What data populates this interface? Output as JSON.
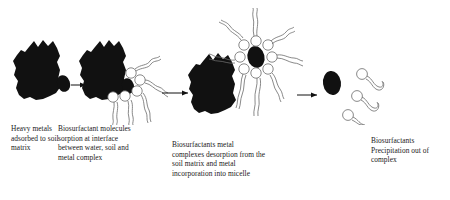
{
  "diagram": {
    "background_color": "#ffffff",
    "ink_color": "#111111",
    "outline_color": "#6b6b6b",
    "stages": [
      {
        "id": "stage-1",
        "caption": "Heavy metals\nadsorbed to soil\nmatrix",
        "elements": [
          "soil-matrix-blob",
          "heavy-metal-particle"
        ]
      },
      {
        "id": "stage-2",
        "caption": "Biosurfactant molecules\nsorption at interface\nbetween water, soil and\nmetal complex",
        "elements": [
          "soil-matrix-blob",
          "heavy-metal-particle",
          "biosurfactant-molecule"
        ]
      },
      {
        "id": "stage-3",
        "caption": "Biosurfactants metal\ncomplexes desorption from the\nsoil matrix and metal\nincorporation into micelle",
        "elements": [
          "soil-matrix-blob",
          "micelle",
          "metal-core",
          "biosurfactant-molecule"
        ]
      },
      {
        "id": "stage-4",
        "caption": "Biosurfactants\nPrecipitation out of\ncomplex",
        "elements": [
          "free-metal-particle",
          "free-biosurfactant-molecule"
        ]
      }
    ],
    "arrows": [
      {
        "id": "arrow-1",
        "from": "stage-1",
        "to": "stage-2"
      },
      {
        "id": "arrow-2",
        "from": "stage-2",
        "to": "stage-3"
      },
      {
        "id": "arrow-3",
        "from": "stage-3",
        "to": "stage-4"
      }
    ]
  }
}
